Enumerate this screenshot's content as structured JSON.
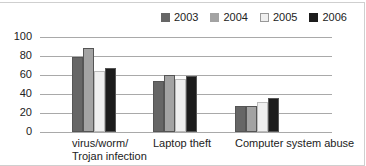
{
  "chart_data": {
    "type": "bar",
    "title": "",
    "xlabel": "",
    "ylabel": "",
    "ylim": [
      0,
      100
    ],
    "yticks": [
      0,
      20,
      40,
      60,
      80,
      100
    ],
    "grid": true,
    "legend_position": "top-right",
    "categories": [
      "virus/worm/ Trojan infection",
      "Laptop theft",
      "Computer system abuse"
    ],
    "category_lines": [
      [
        "virus/worm/",
        "Trojan infection"
      ],
      [
        "Laptop theft"
      ],
      [
        "Computer system abuse"
      ]
    ],
    "series": [
      {
        "name": "2003",
        "color": "#666666",
        "values": [
          79,
          54,
          27
        ]
      },
      {
        "name": "2004",
        "color": "#a3a3a3",
        "values": [
          88,
          60,
          27
        ]
      },
      {
        "name": "2005",
        "color": "#efefef",
        "values": [
          64,
          56,
          32
        ]
      },
      {
        "name": "2006",
        "color": "#1c1c1c",
        "values": [
          67,
          59,
          36
        ]
      }
    ]
  }
}
